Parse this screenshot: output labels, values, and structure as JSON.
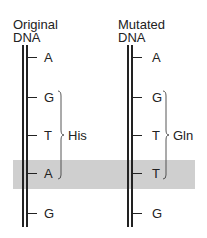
{
  "left": {
    "title_line1": "Original",
    "title_line2": "DNA",
    "bases": [
      "A",
      "G",
      "T",
      "A",
      "G"
    ],
    "amino_acid": "His"
  },
  "right": {
    "title_line1": "Mutated",
    "title_line2": "DNA",
    "bases": [
      "A",
      "G",
      "T",
      "T",
      "G"
    ],
    "amino_acid": "Gln"
  },
  "colors": {
    "highlight": "#cfcfcf",
    "line": "#222222"
  }
}
